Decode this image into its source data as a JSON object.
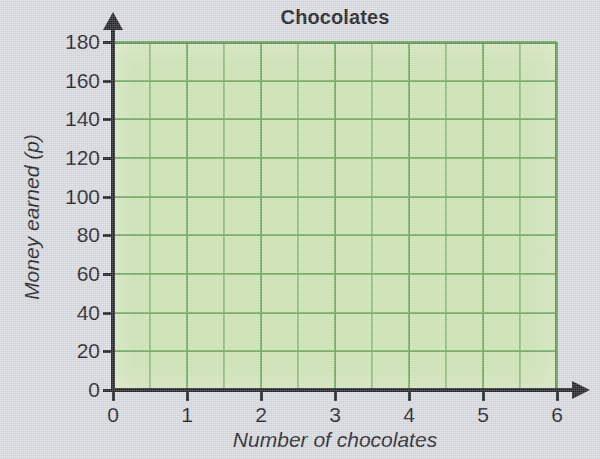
{
  "chart_data": {
    "type": "line",
    "title": "Chocolates",
    "xlabel": "Number of chocolates",
    "ylabel": "Money earned (p)",
    "xlim": [
      0,
      6
    ],
    "ylim": [
      0,
      180
    ],
    "x_ticks": [
      "0",
      "1",
      "2",
      "3",
      "4",
      "5",
      "6"
    ],
    "y_ticks": [
      "0",
      "20",
      "40",
      "60",
      "80",
      "100",
      "120",
      "140",
      "160",
      "180"
    ],
    "x_tick_values": [
      0,
      1,
      2,
      3,
      4,
      5,
      6
    ],
    "y_tick_values": [
      0,
      20,
      40,
      60,
      80,
      100,
      120,
      140,
      160,
      180
    ],
    "grid": true,
    "x_minor_gridline_step": 0.5,
    "y_gridline_step": 20,
    "legend": null,
    "series": [],
    "values": [],
    "annotations": [],
    "note": "Empty grid provided for plotting; no data points drawn"
  },
  "style": {
    "plot_fill": "#c9e3a8",
    "gridline_color": "#62a34e",
    "axis_color": "#151419",
    "background": "#d6d9de",
    "title_color": "#100f12"
  }
}
